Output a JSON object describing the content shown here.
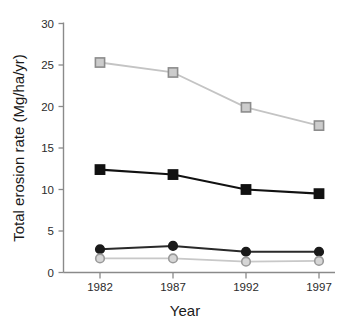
{
  "chart_data": {
    "type": "line",
    "title": "",
    "subtitle": "",
    "xlabel": "Year",
    "ylabel": "Total erosion rate (Mg/ha/yr)",
    "categories": [
      "1982",
      "1987",
      "1992",
      "1997"
    ],
    "x": [
      1982,
      1987,
      1992,
      1997
    ],
    "xlim": [
      1980,
      1999
    ],
    "ylim": [
      0,
      30
    ],
    "yticks": [
      0,
      5,
      10,
      15,
      20,
      25,
      30
    ],
    "ytick_labels": [
      "0",
      "5",
      "10",
      "15",
      "20",
      "25",
      "30"
    ],
    "xtick_labels": [
      "1982",
      "1987",
      "1992",
      "1997"
    ],
    "grid": false,
    "legend": "none",
    "series": [
      {
        "name": "gray-open-square-series",
        "marker": "square",
        "marker_fill": "#cccccc",
        "marker_edge": "#8c8c8c",
        "line_color": "#c4c4c4",
        "values": [
          25.3,
          24.1,
          19.9,
          17.7
        ]
      },
      {
        "name": "black-filled-square-series",
        "marker": "square",
        "marker_fill": "#111111",
        "marker_edge": "#111111",
        "line_color": "#111111",
        "values": [
          12.4,
          11.8,
          10.0,
          9.5
        ]
      },
      {
        "name": "black-filled-circle-series",
        "marker": "circle",
        "marker_fill": "#1a1a1a",
        "marker_edge": "#1a1a1a",
        "line_color": "#2a2a2a",
        "values": [
          2.8,
          3.2,
          2.5,
          2.5
        ]
      },
      {
        "name": "gray-open-circle-series",
        "marker": "circle",
        "marker_fill": "#d6d6d6",
        "marker_edge": "#9a9a9a",
        "line_color": "#c8c8c8",
        "values": [
          1.7,
          1.7,
          1.3,
          1.4
        ]
      }
    ]
  },
  "axes": {
    "y_title": "Total erosion rate (Mg/ha/yr)",
    "x_title": "Year",
    "y_tick_0": "0",
    "y_tick_5": "5",
    "y_tick_10": "10",
    "y_tick_15": "15",
    "y_tick_20": "20",
    "y_tick_25": "25",
    "y_tick_30": "30",
    "x_tick_1": "1982",
    "x_tick_2": "1987",
    "x_tick_3": "1992",
    "x_tick_4": "1997"
  },
  "colors": {
    "axis": "#8a8a8a",
    "text": "#1a1a1a",
    "dark_series": "#111111",
    "light_series": "#c4c4c4",
    "background": "#ffffff"
  }
}
